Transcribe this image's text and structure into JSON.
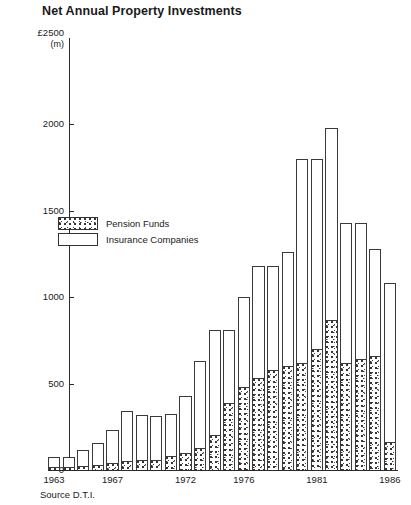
{
  "chart_data": {
    "type": "bar",
    "title": "Net Annual Property Investments",
    "subtitle": "",
    "xlabel": "",
    "ylabel": "£2500",
    "ylabel_unit": "(m)",
    "ylim": [
      0,
      2500
    ],
    "yticks": [
      0,
      500,
      1000,
      1500,
      2000,
      2500
    ],
    "ytick_labels": [
      "0",
      "500",
      "1000",
      "1500",
      "2000",
      "2500"
    ],
    "grid": false,
    "stacked": true,
    "legend_position": "inside-left",
    "legend": [
      "Pension Funds",
      "Insurance Companies"
    ],
    "source": "Source D.T.I.",
    "categories": [
      "1963",
      "1964",
      "1965",
      "1966",
      "1967",
      "1968",
      "1969",
      "1970",
      "1971",
      "1972",
      "1973",
      "1974",
      "1975",
      "1976",
      "1977",
      "1978",
      "1979",
      "1980",
      "1981",
      "1982",
      "1983",
      "1984",
      "1985",
      "1986"
    ],
    "xtick_labels": [
      "1963",
      "1967",
      "1972",
      "1976",
      "1981",
      "1986"
    ],
    "series": [
      {
        "name": "Pension Funds",
        "values": [
          20,
          20,
          25,
          30,
          40,
          50,
          55,
          60,
          80,
          100,
          130,
          200,
          390,
          480,
          530,
          580,
          600,
          620,
          700,
          870,
          620,
          640,
          660,
          160
        ]
      },
      {
        "name": "Insurance Companies",
        "values": [
          55,
          55,
          90,
          125,
          190,
          290,
          265,
          250,
          245,
          330,
          500,
          610,
          420,
          520,
          650,
          600,
          660,
          1180,
          1100,
          1110,
          810,
          790,
          620,
          920
        ]
      }
    ],
    "totals": [
      75,
      75,
      115,
      155,
      230,
      340,
      320,
      310,
      325,
      430,
      630,
      810,
      810,
      1000,
      1180,
      1180,
      1260,
      1800,
      1800,
      1980,
      1430,
      1430,
      1280,
      1080
    ]
  }
}
